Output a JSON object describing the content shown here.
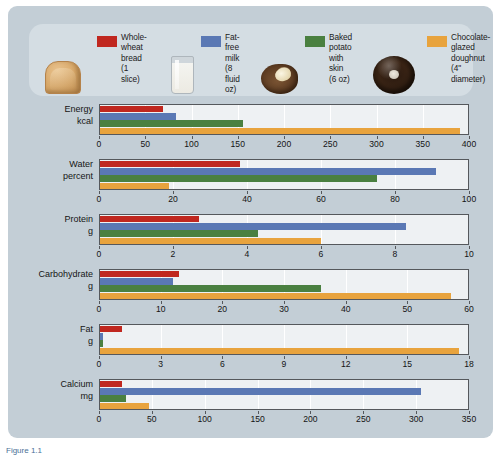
{
  "legend": {
    "items": [
      {
        "label": "Whole-\nwheat bread\n(1 slice)",
        "color": "#c0271f",
        "thumb": "bread-slice-image",
        "swatch_name": "legend-swatch-whole-wheat-bread"
      },
      {
        "label": "Fat-free\nmilk\n(8 fluid oz)",
        "color": "#5a78b4",
        "thumb": "milk-glass-image",
        "swatch_name": "legend-swatch-fat-free-milk"
      },
      {
        "label": "Baked\npotato with\nskin (6 oz)",
        "color": "#4a8040",
        "thumb": "baked-potato-image",
        "swatch_name": "legend-swatch-baked-potato"
      },
      {
        "label": "Chocolate-glazed\ndoughnut\n(4\" diameter)",
        "color": "#e8a33d",
        "thumb": "chocolate-doughnut-image",
        "swatch_name": "legend-swatch-chocolate-doughnut"
      }
    ]
  },
  "caption": "Figure 1.1",
  "chart_data": {
    "type": "bar",
    "title": "",
    "orientation": "horizontal",
    "grid": true,
    "legend_position": "top",
    "series": [
      {
        "name": "Whole-wheat bread (1 slice)",
        "color": "#c0271f"
      },
      {
        "name": "Fat-free milk (8 fluid oz)",
        "color": "#5a78b4"
      },
      {
        "name": "Baked potato with skin (6 oz)",
        "color": "#4a8040"
      },
      {
        "name": "Chocolate-glazed doughnut (4\" diameter)",
        "color": "#e8a33d"
      }
    ],
    "panels": [
      {
        "name": "Energy",
        "label": "Energy\nkcal",
        "unit": "kcal",
        "xlim": [
          0,
          400
        ],
        "ticks": [
          0,
          50,
          100,
          150,
          200,
          250,
          300,
          350,
          400
        ],
        "values": [
          69,
          83,
          156,
          390
        ]
      },
      {
        "name": "Water",
        "label": "Water\npercent",
        "unit": "percent",
        "xlim": [
          0,
          100
        ],
        "ticks": [
          0,
          20,
          40,
          60,
          80,
          100
        ],
        "values": [
          38,
          91,
          75,
          19
        ]
      },
      {
        "name": "Protein",
        "label": "Protein\ng",
        "unit": "g",
        "xlim": [
          0,
          10
        ],
        "ticks": [
          0,
          2,
          4,
          6,
          8,
          10
        ],
        "values": [
          2.7,
          8.3,
          4.3,
          6.0
        ]
      },
      {
        "name": "Carbohydrate",
        "label": "Carbohydrate\ng",
        "unit": "g",
        "xlim": [
          0,
          60
        ],
        "ticks": [
          0,
          10,
          20,
          30,
          40,
          50,
          60
        ],
        "values": [
          13,
          12,
          36,
          57
        ]
      },
      {
        "name": "Fat",
        "label": "Fat\ng",
        "unit": "g",
        "xlim": [
          0,
          18
        ],
        "ticks": [
          0,
          3,
          6,
          9,
          12,
          15,
          18
        ],
        "values": [
          1.1,
          0.2,
          0.2,
          17.5
        ]
      },
      {
        "name": "Calcium",
        "label": "Calcium\nmg",
        "unit": "mg",
        "xlim": [
          0,
          350
        ],
        "ticks": [
          0,
          50,
          100,
          150,
          200,
          250,
          300,
          350
        ],
        "values": [
          22,
          305,
          26,
          47
        ]
      }
    ]
  }
}
